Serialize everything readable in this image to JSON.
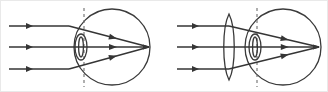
{
  "figure": {
    "width": 328,
    "height": 92,
    "background_color": "#ffffff",
    "line_color": "#353535",
    "dashed_line_color": "#6d6d6d",
    "panels": [
      {
        "id": "left-panel",
        "name": "uncorrected-eye",
        "label": "",
        "eyeball": {
          "cx": 111,
          "cy": 46,
          "r": 38
        },
        "eye_lens": {
          "cx": 80,
          "cy": 46,
          "rx": 6,
          "ry": 13
        },
        "optical_axis_y": 46,
        "dashed_line_x": 83,
        "focus_point": {
          "x": 148,
          "y": 46
        },
        "refraction_x": 68,
        "incoming_rays": [
          {
            "y": 25,
            "x_start": 8,
            "x_end": 68,
            "arrow_x": 32
          },
          {
            "y": 46,
            "x_start": 8,
            "x_end": 68,
            "arrow_x": 32
          },
          {
            "y": 68,
            "x_start": 8,
            "x_end": 68,
            "arrow_x": 32
          }
        ],
        "converging_rays": [
          {
            "from_x": 68,
            "from_y": 25,
            "to_x": 148,
            "to_y": 46,
            "arrow_t": 0.55
          },
          {
            "from_x": 68,
            "from_y": 46,
            "to_x": 148,
            "to_y": 46,
            "arrow_t": 0.55
          },
          {
            "from_x": 68,
            "from_y": 68,
            "to_x": 148,
            "to_y": 46,
            "arrow_t": 0.55
          }
        ]
      },
      {
        "id": "right-panel",
        "name": "corrected-eye-with-lens",
        "label": "",
        "eyeball": {
          "cx": 282,
          "cy": 46,
          "r": 38
        },
        "eye_lens": {
          "cx": 254,
          "cy": 46,
          "rx": 6,
          "ry": 13
        },
        "external_lens": {
          "cx": 228,
          "cy": 46,
          "half_width": 7,
          "half_height": 33
        },
        "optical_axis_y": 46,
        "dashed_line_x": 256,
        "focus_point": {
          "x": 318,
          "y": 46
        },
        "refraction_x": 228,
        "incoming_rays": [
          {
            "y": 25,
            "x_start": 176,
            "x_end": 228,
            "arrow_x": 198
          },
          {
            "y": 46,
            "x_start": 176,
            "x_end": 228,
            "arrow_x": 198
          },
          {
            "y": 68,
            "x_start": 176,
            "x_end": 228,
            "arrow_x": 198
          }
        ],
        "converging_rays": [
          {
            "from_x": 228,
            "from_y": 25,
            "to_x": 318,
            "to_y": 46,
            "arrow_t": 0.62
          },
          {
            "from_x": 228,
            "from_y": 46,
            "to_x": 318,
            "to_y": 46,
            "arrow_t": 0.62
          },
          {
            "from_x": 228,
            "from_y": 68,
            "to_x": 318,
            "to_y": 46,
            "arrow_t": 0.62
          }
        ]
      }
    ]
  }
}
